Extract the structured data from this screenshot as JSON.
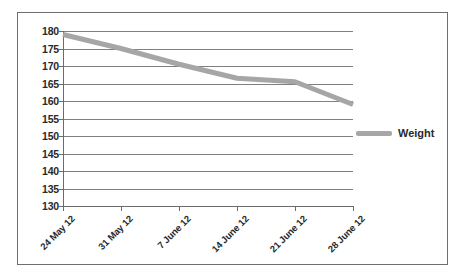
{
  "chart_data": {
    "type": "line",
    "title": "",
    "xlabel": "",
    "ylabel": "",
    "ylim": [
      130,
      180
    ],
    "ytick_step": 5,
    "yticks": [
      180,
      175,
      170,
      165,
      160,
      155,
      150,
      145,
      140,
      135,
      130
    ],
    "grid": true,
    "legend_position": "right",
    "categories": [
      "24 May 12",
      "31 May 12",
      "7 June 12",
      "14 June 12",
      "21 June 12",
      "28 June 12"
    ],
    "series": [
      {
        "name": "Weight",
        "color": "#a6a6a6",
        "values": [
          179,
          175,
          170.5,
          166.5,
          165.5,
          159
        ]
      }
    ]
  },
  "legend": {
    "entries": [
      {
        "label": "Weight",
        "swatch": "legend-swatch-weight"
      }
    ]
  },
  "colors": {
    "series_gray": "#a6a6a6",
    "gridline": "#808080",
    "axis": "#6b6b6b",
    "border": "#6e6e6e",
    "text": "#2a2a2a",
    "background": "#ffffff"
  }
}
